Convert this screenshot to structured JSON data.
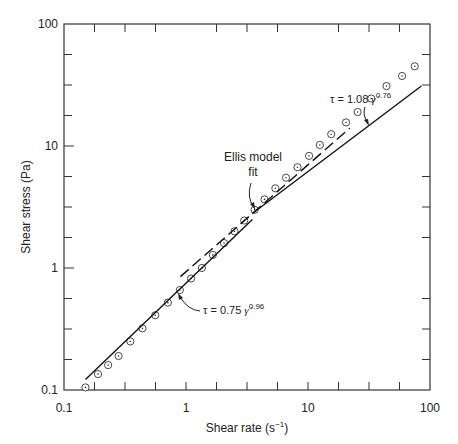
{
  "chart_data": {
    "type": "scatter",
    "title": "",
    "xlabel": "Shear rate (s⁻¹)",
    "ylabel": "Shear stress (Pa)",
    "xscale": "log",
    "yscale": "log",
    "xlim": [
      0.1,
      100
    ],
    "ylim": [
      0.1,
      100
    ],
    "xticks": [
      "0.1",
      "1",
      "10",
      "100"
    ],
    "yticks": [
      "0.1",
      "1",
      "10",
      "100"
    ],
    "grid": false,
    "series": [
      {
        "name": "Measured data",
        "marker": "circle-dot",
        "x": [
          0.15,
          0.19,
          0.23,
          0.28,
          0.35,
          0.44,
          0.56,
          0.71,
          0.89,
          1.1,
          1.35,
          1.66,
          2.05,
          2.5,
          3.0,
          3.65,
          4.4,
          5.4,
          6.6,
          8.2,
          10.2,
          12.5,
          15.5,
          20.5,
          25.5,
          33,
          44,
          59,
          75
        ],
        "y": [
          0.105,
          0.135,
          0.16,
          0.19,
          0.25,
          0.32,
          0.41,
          0.52,
          0.66,
          0.82,
          1.0,
          1.28,
          1.6,
          2.0,
          2.45,
          3.0,
          3.65,
          4.5,
          5.5,
          6.7,
          8.3,
          10.2,
          12.5,
          15.6,
          19.0,
          24.5,
          31,
          37.5,
          45
        ]
      },
      {
        "name": "Power law fit low (τ = 0.75 γ̇^0.96)",
        "style": "solid",
        "x": [
          0.15,
          3.5
        ],
        "y": [
          0.122,
          2.5
        ]
      },
      {
        "name": "Power law fit high (τ = 1.08 γ̇^0.76)",
        "style": "solid",
        "x": [
          3.5,
          85
        ],
        "y": [
          2.8,
          31
        ]
      },
      {
        "name": "Ellis model fit",
        "style": "dashed",
        "x": [
          0.9,
          22
        ],
        "y": [
          0.85,
          14
        ]
      }
    ],
    "annotations": [
      {
        "text": "Ellis model fit",
        "x": 3.6,
        "y": 2.9
      },
      {
        "text": "τ = 0.75 γ̇^0.96",
        "x": 0.85,
        "y": 0.62
      },
      {
        "text": "τ = 1.08 γ̇^0.76",
        "x": 32,
        "y": 15
      }
    ]
  },
  "labels": {
    "xlabel": "Shear rate (s",
    "xlabel_sup": "−1",
    "xlabel_end": ")",
    "ylabel": "Shear stress (Pa)",
    "xticks": [
      "0.1",
      "1",
      "10",
      "100"
    ],
    "yticks": [
      "0.1",
      "1",
      "10",
      "100"
    ],
    "ellis_line1": "Ellis model",
    "ellis_line2": "fit",
    "low_eq_prefix": "τ = 0.75 ",
    "low_eq_gamma": "γ̇",
    "low_eq_exp": "0.96",
    "high_eq_prefix": "τ = 1.08 ",
    "high_eq_gamma": "γ̇",
    "high_eq_exp": "0.76"
  }
}
